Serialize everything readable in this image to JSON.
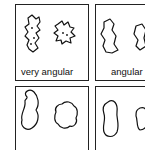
{
  "figure": {
    "panels": [
      {
        "id": "p1",
        "label": "very angular"
      },
      {
        "id": "p2",
        "label": "angular"
      },
      {
        "id": "p3",
        "label": ""
      },
      {
        "id": "p4",
        "label": ""
      }
    ]
  }
}
